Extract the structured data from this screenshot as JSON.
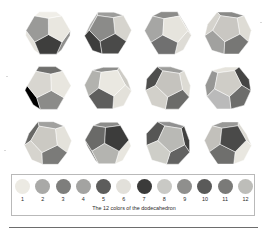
{
  "figure": {
    "caption": "The 12 colors of the dodecahedron",
    "grid": {
      "columns": 4,
      "rows": 3,
      "count": 12
    }
  },
  "chart_data": {
    "type": "table",
    "title": "The 12 colors of the dodecahedron",
    "xlabel": "",
    "ylabel": "",
    "categories": [
      "1",
      "2",
      "3",
      "4",
      "5",
      "6",
      "7",
      "8",
      "9",
      "10",
      "11",
      "12"
    ],
    "values": [
      1,
      2,
      3,
      4,
      5,
      6,
      7,
      8,
      9,
      10,
      11,
      12
    ],
    "legend_position": "bottom",
    "grid_on": false,
    "swatches": [
      {
        "index": "1",
        "color": "#eceae3"
      },
      {
        "index": "2",
        "color": "#a9a9a7"
      },
      {
        "index": "3",
        "color": "#7e7e7c"
      },
      {
        "index": "4",
        "color": "#a3a3a1"
      },
      {
        "index": "5",
        "color": "#5d5d5c"
      },
      {
        "index": "6",
        "color": "#e2e0da"
      },
      {
        "index": "7",
        "color": "#3b3b3a"
      },
      {
        "index": "8",
        "color": "#c9c9c5"
      },
      {
        "index": "9",
        "color": "#8f8f8d"
      },
      {
        "index": "10",
        "color": "#5a5a59"
      },
      {
        "index": "11",
        "color": "#7a7a78"
      },
      {
        "index": "12",
        "color": "#bdbdb9"
      }
    ],
    "solids": [
      {
        "position": "row1-col1",
        "name": "dodecahedron-1",
        "faces": [
          "#e9e7e0",
          "#d3d1cb",
          "#f0eee8",
          "#9a9a98",
          "#3e3e3d",
          "#8f8f8d",
          "#cfcdc7",
          "#5a5a59",
          "#b5b5b1",
          "#e4e2dc",
          "#a8a8a6",
          "#6e6e6c"
        ]
      },
      {
        "position": "row1-col2",
        "name": "dodecahedron-2",
        "faces": [
          "#d6d4ce",
          "#e8e6df",
          "#9d9d9b",
          "#8b8b89",
          "#4a4a49",
          "#bfbfbb",
          "#e3e1da",
          "#787876",
          "#aeaeac",
          "#3d3d3c",
          "#c8c6c1",
          "#6a6a68"
        ]
      },
      {
        "position": "row1-col3",
        "name": "dodecahedron-3",
        "faces": [
          "#e6e4dd",
          "#c4c2bd",
          "#8c8c8a",
          "#a6a6a4",
          "#707070",
          "#dedcd6",
          "#9b9b99",
          "#bbbbb7",
          "#5e5e5d",
          "#eceae3",
          "#82827f",
          "#d0cec8"
        ]
      },
      {
        "position": "row1-col4",
        "name": "dodecahedron-4",
        "faces": [
          "#dedcd5",
          "#b6b6b2",
          "#8a8a88",
          "#c9c7c2",
          "#777775",
          "#eae8e1",
          "#9f9f9d",
          "#5c5c5b",
          "#d5d3cd",
          "#a1a19f",
          "#e5e3dc",
          "#6d6d6b"
        ]
      },
      {
        "position": "row2-col1",
        "name": "dodecahedron-5",
        "faces": [
          "#e8e6df",
          "#c0c0bc",
          "#6f6f6d",
          "#d8d6d0",
          "#8b8b89",
          "#efede6",
          "#a5a5a3",
          "#5f5f5e",
          "#cbc9c4",
          "#9797955",
          "#e2e0d9",
          "#7c7c7a"
        ]
      },
      {
        "position": "row2-col2",
        "name": "dodecahedron-6",
        "faces": [
          "#eae8e1",
          "#cdcbc5",
          "#8e8e8c",
          "#b2b2ae",
          "#5e5e5d",
          "#e3e1da",
          "#9a9a98",
          "#757573",
          "#d7d5cf",
          "#a9a9a7",
          "#f0eee7",
          "#66666 4"
        ]
      },
      {
        "position": "row2-col3",
        "name": "dodecahedron-7",
        "faces": [
          "#dddbd4",
          "#3a3a39",
          "#9d9d9b",
          "#c5c3be",
          "#6b6b69",
          "#e9e7e0",
          "#868684",
          "#b0b0ac",
          "#4e4e4d",
          "#d2d0ca",
          "#a4a4a2",
          "#727270"
        ]
      },
      {
        "position": "row2-col4",
        "name": "dodecahedron-8",
        "faces": [
          "#cfcdc7",
          "#454544",
          "#e6e4dd",
          "#97979 5",
          "#bababa",
          "#6d6d6b",
          "#ddd b d4",
          "#80807e",
          "#a8a8a6",
          "#585857",
          "#ebe9e2",
          "#c3c1bc"
        ]
      },
      {
        "position": "row3-col1",
        "name": "dodecahedron-9",
        "faces": [
          "#e4e2db",
          "#5d5d5c",
          "#a1a1 9f",
          "#cbc9c3",
          "#7b7b79",
          "#ecea e3",
          "#919191",
          "#b8b8b4",
          "#686866",
          "#d6d4ce",
          "#aaaaa8",
          "#7f7f7d"
        ]
      },
      {
        "position": "row3-col2",
        "name": "dodecahedron-10",
        "faces": [
          "#3c3c3b",
          "#dbd9d2",
          "#8c8c8a",
          "#6a6a68",
          "#b4b4b0",
          "#e8e6df",
          "#52 5251",
          "#9d9d9b",
          "#c6c4bf",
          "#76767 4",
          "#f0eee7",
          "#a8a8a6"
        ]
      },
      {
        "position": "row3-col3",
        "name": "dodecahedron-11",
        "faces": [
          "#414140",
          "#d2d0ca",
          "#909090",
          "#b9b9b5",
          "#636362",
          "#e5e3dc",
          "#858583",
          "#a6a6a4",
          "#56 5655",
          "#cecec8",
          "#9b9b99",
          "#ebe9e2"
        ]
      },
      {
        "position": "row3-col4",
        "name": "dodecahedron-12",
        "faces": [
          "#4a4a49",
          "#dcdad3",
          "#999997",
          "#c2c0bb",
          "#6f6f6d",
          "#e9e7e0",
          "#8a8a88",
          "#b0b0ac",
          "#5e5e5d",
          "#d5d3cd",
          "#a3a3a1",
          "#f0eee8"
        ]
      }
    ]
  }
}
